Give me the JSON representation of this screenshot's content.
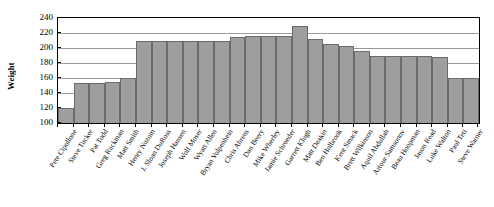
{
  "chart_data": {
    "type": "bar",
    "title": "",
    "xlabel": "",
    "ylabel": "Weight",
    "ylim": [
      100,
      240
    ],
    "ytick_step": 20,
    "yticks": [
      240,
      220,
      200,
      180,
      160,
      140,
      120,
      100
    ],
    "grid": true,
    "legend": null,
    "bar_color": "#9e9e9e",
    "bar_edge_color": "#6b6b6b",
    "categories": [
      "Pete Cipollone",
      "Steve Tucker",
      "Pat Todd",
      "Greg Ruckman",
      "Matt Smith",
      "Henry Nuzum",
      "J. Sloan DuRoss",
      "Joseph Hansen",
      "Wolf Moser",
      "Wyatt Allen",
      "Bryan Volpenhein",
      "Chris Ahrens",
      "Dan Beery",
      "Mike Wherley",
      "Jamie Schroeder",
      "Garrett Klugh",
      "Matt Deakin",
      "Ben Holbrook",
      "Kent Smack",
      "Brett Wilkinson",
      "Aquil Abdullah",
      "Artour Samsonov",
      "Beau Hoopman",
      "Jason Read",
      "Luke Walton",
      "Paul Teti",
      "Steve Warner"
    ],
    "values": [
      120,
      153,
      154,
      155,
      160,
      210,
      210,
      210,
      210,
      210,
      210,
      215,
      216,
      216,
      216,
      230,
      212,
      205,
      203,
      196,
      190,
      190,
      190,
      190,
      188,
      160,
      160
    ],
    "series": [
      {
        "name": "Weight",
        "values": [
          120,
          153,
          154,
          155,
          160,
          210,
          210,
          210,
          210,
          210,
          210,
          215,
          216,
          216,
          216,
          230,
          212,
          205,
          203,
          196,
          190,
          190,
          190,
          190,
          188,
          160,
          160
        ]
      }
    ]
  }
}
